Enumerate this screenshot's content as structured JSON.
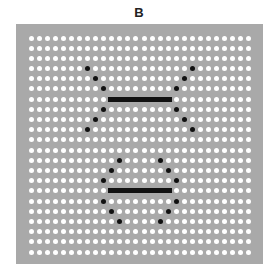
{
  "title": "B",
  "grid": {
    "columns": 28,
    "rows": 22,
    "origin_x": 31,
    "origin_y": 38,
    "spacing_x": 8.07,
    "spacing_y": 10.19,
    "dot_color": "#ffffff",
    "background_color": "#a9a9a9"
  },
  "highlight_color": "#111111",
  "structures": [
    {
      "name": "upper",
      "black_dots": [
        [
          3,
          7
        ],
        [
          4,
          8
        ],
        [
          5,
          9
        ],
        [
          7,
          9
        ],
        [
          8,
          8
        ],
        [
          9,
          7
        ],
        [
          3,
          20
        ],
        [
          4,
          19
        ],
        [
          5,
          18
        ],
        [
          7,
          18
        ],
        [
          8,
          19
        ],
        [
          9,
          20
        ]
      ],
      "bar": {
        "row": 6,
        "col_start": 10,
        "col_end": 17
      }
    },
    {
      "name": "lower",
      "black_dots": [
        [
          12,
          11
        ],
        [
          13,
          10
        ],
        [
          14,
          9
        ],
        [
          16,
          9
        ],
        [
          17,
          10
        ],
        [
          18,
          11
        ],
        [
          12,
          16
        ],
        [
          13,
          17
        ],
        [
          14,
          18
        ],
        [
          16,
          18
        ],
        [
          17,
          17
        ],
        [
          18,
          16
        ]
      ],
      "bar": {
        "row": 15,
        "col_start": 10,
        "col_end": 17
      }
    }
  ]
}
